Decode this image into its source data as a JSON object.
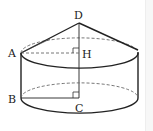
{
  "figure": {
    "labels": {
      "D": "D",
      "A": "A",
      "H": "H",
      "B": "B",
      "C": "C"
    },
    "colors": {
      "stroke": "#222222",
      "dashed": "#555555",
      "background": "#ffffff"
    }
  }
}
